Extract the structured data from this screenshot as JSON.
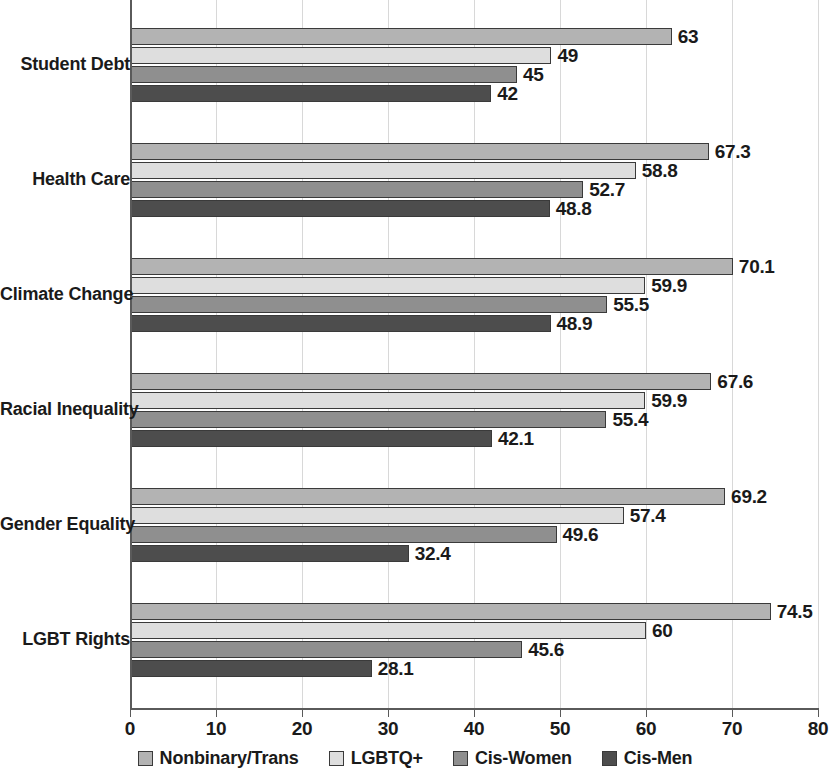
{
  "chart_data": {
    "type": "bar",
    "orientation": "horizontal",
    "title": "",
    "subtitle": "",
    "xlabel": "",
    "ylabel": "",
    "xlim": [
      0,
      80
    ],
    "xticks": [
      "0",
      "10",
      "20",
      "30",
      "40",
      "50",
      "60",
      "70",
      "80"
    ],
    "xtick_values": [
      0,
      10,
      20,
      30,
      40,
      50,
      60,
      70,
      80
    ],
    "grid": true,
    "grid_axis": "x",
    "legend_position": "bottom",
    "categories": [
      "Student Debt",
      "Health Care",
      "Climate Change",
      "Racial Inequality",
      "Gender Equality",
      "LGBT Rights"
    ],
    "series": [
      {
        "name": "Nonbinary/Trans",
        "color": "#b3b3b3",
        "values": [
          63,
          67.3,
          70.1,
          67.6,
          69.2,
          74.5
        ],
        "labels": [
          "63",
          "67.3",
          "70.1",
          "67.6",
          "69.2",
          "74.5"
        ]
      },
      {
        "name": "LGBTQ+",
        "color": "#dedede",
        "values": [
          49,
          58.8,
          59.9,
          59.9,
          57.4,
          60
        ],
        "labels": [
          "49",
          "58.8",
          "59.9",
          "59.9",
          "57.4",
          "60"
        ]
      },
      {
        "name": "Cis-Women",
        "color": "#8f8f8f",
        "values": [
          45,
          52.7,
          55.5,
          55.4,
          49.6,
          45.6
        ],
        "labels": [
          "45",
          "52.7",
          "55.5",
          "55.4",
          "49.6",
          "45.6"
        ]
      },
      {
        "name": "Cis-Men",
        "color": "#4d4d4d",
        "values": [
          42,
          48.8,
          48.9,
          42.1,
          32.4,
          28.1
        ],
        "labels": [
          "42",
          "48.8",
          "48.9",
          "42.1",
          "32.4",
          "28.1"
        ]
      }
    ]
  }
}
